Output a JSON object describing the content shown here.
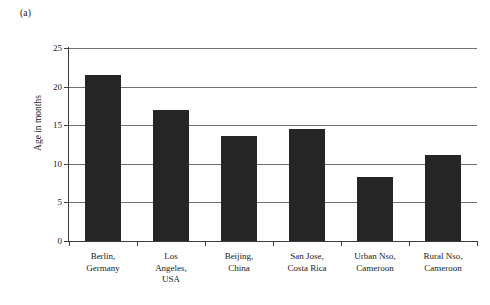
{
  "figure": {
    "panel_label": "(a)"
  },
  "chart_data": {
    "type": "bar",
    "title": "",
    "xlabel": "",
    "ylabel": "Age in months",
    "categories": [
      "Berlin,\nGermany",
      "Los\nAngeles,\nUSA",
      "Beijing,\nChina",
      "San Jose,\nCosta Rica",
      "Urban Nso,\nCameroon",
      "Rural Nso,\nCameroon"
    ],
    "category_lines": [
      [
        "Berlin,",
        "Germany"
      ],
      [
        "Los",
        "Angeles,",
        "USA"
      ],
      [
        "Beijing,",
        "China"
      ],
      [
        "San Jose,",
        "Costa Rica"
      ],
      [
        "Urban Nso,",
        "Cameroon"
      ],
      [
        "Rural Nso,",
        "Cameroon"
      ]
    ],
    "values": [
      21.5,
      17.0,
      13.6,
      14.5,
      8.3,
      11.2
    ],
    "ylim": [
      0,
      25
    ],
    "yticks": [
      0,
      5,
      10,
      15,
      20,
      25
    ],
    "ytick_labels": [
      "0",
      "5",
      "10",
      "15",
      "20",
      "25"
    ],
    "grid": true,
    "legend": false,
    "bar_color": "#262626",
    "grid_color": "#6f6f6f",
    "axis_color": "#3a3a3a"
  }
}
